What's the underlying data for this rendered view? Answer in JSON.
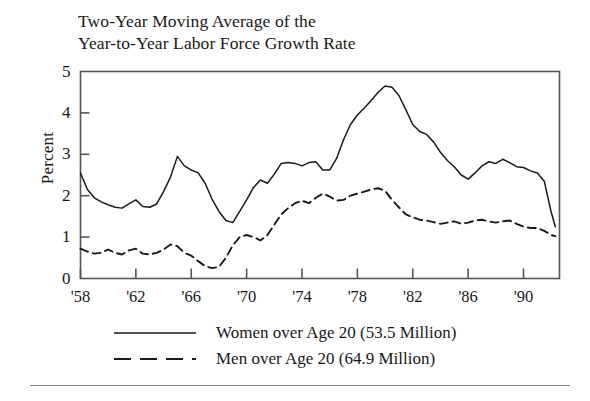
{
  "title": {
    "line1": "Two-Year Moving Average of the",
    "line2": "Year-to-Year Labor Force Growth Rate"
  },
  "axes": {
    "ylabel": "Percent",
    "yticks": [
      "0",
      "1",
      "2",
      "3",
      "4",
      "5"
    ],
    "xticks": [
      "'58",
      "'62",
      "'66",
      "'70",
      "'74",
      "'78",
      "'82",
      "'86",
      "'90"
    ]
  },
  "legend": {
    "items": [
      {
        "label": "Women over Age 20 (53.5 Million)",
        "style": "solid",
        "color": "#1a1a1a"
      },
      {
        "label": "Men over Age 20 (64.9 Million)",
        "style": "dashed",
        "color": "#1a1a1a"
      }
    ]
  },
  "colors": {
    "ink": "#1a1a1a",
    "frame": "#555555",
    "rule": "#8a8a8a",
    "background": "#ffffff"
  },
  "chart_data": {
    "type": "line",
    "title": "Two-Year Moving Average of the Year-to-Year Labor Force Growth Rate",
    "xlabel": "",
    "ylabel": "Percent",
    "xlim": [
      1958,
      1992.6
    ],
    "ylim": [
      0,
      5
    ],
    "grid": false,
    "legend_position": "below",
    "x_tick_values": [
      1958,
      1962,
      1966,
      1970,
      1974,
      1978,
      1982,
      1986,
      1990
    ],
    "x_tick_labels": [
      "'58",
      "'62",
      "'66",
      "'70",
      "'74",
      "'78",
      "'82",
      "'86",
      "'90"
    ],
    "y_tick_values": [
      0,
      1,
      2,
      3,
      4,
      5
    ],
    "y_tick_labels": [
      "0",
      "1",
      "2",
      "3",
      "4",
      "5"
    ],
    "x": [
      1958.0,
      1958.5,
      1959.0,
      1959.5,
      1960.0,
      1960.5,
      1961.0,
      1961.5,
      1962.0,
      1962.5,
      1963.0,
      1963.5,
      1964.0,
      1964.5,
      1965.0,
      1965.5,
      1966.0,
      1966.5,
      1967.0,
      1967.5,
      1968.0,
      1968.5,
      1969.0,
      1969.5,
      1970.0,
      1970.5,
      1971.0,
      1971.5,
      1972.0,
      1972.5,
      1973.0,
      1973.5,
      1974.0,
      1974.5,
      1975.0,
      1975.5,
      1976.0,
      1976.5,
      1977.0,
      1977.5,
      1978.0,
      1978.5,
      1979.0,
      1979.5,
      1980.0,
      1980.5,
      1981.0,
      1981.5,
      1982.0,
      1982.5,
      1983.0,
      1983.5,
      1984.0,
      1984.5,
      1985.0,
      1985.5,
      1986.0,
      1986.5,
      1987.0,
      1987.5,
      1988.0,
      1988.5,
      1989.0,
      1989.5,
      1990.0,
      1990.5,
      1991.0,
      1991.5,
      1992.0,
      1992.3
    ],
    "series": [
      {
        "name": "Women over Age 20 (53.5 Million)",
        "style": "solid",
        "color": "#1a1a1a",
        "values": [
          2.55,
          2.15,
          1.95,
          1.85,
          1.78,
          1.72,
          1.7,
          1.8,
          1.9,
          1.74,
          1.72,
          1.8,
          2.1,
          2.45,
          2.95,
          2.72,
          2.62,
          2.55,
          2.3,
          1.92,
          1.62,
          1.4,
          1.35,
          1.62,
          1.9,
          2.2,
          2.38,
          2.3,
          2.52,
          2.78,
          2.8,
          2.78,
          2.72,
          2.8,
          2.82,
          2.62,
          2.62,
          2.9,
          3.35,
          3.72,
          3.95,
          4.12,
          4.3,
          4.5,
          4.65,
          4.62,
          4.42,
          4.08,
          3.72,
          3.55,
          3.48,
          3.3,
          3.05,
          2.85,
          2.7,
          2.5,
          2.4,
          2.55,
          2.72,
          2.82,
          2.78,
          2.88,
          2.8,
          2.7,
          2.68,
          2.6,
          2.55,
          2.35,
          1.6,
          1.25
        ]
      },
      {
        "name": "Men over Age 20 (64.9 Million)",
        "style": "dashed",
        "color": "#1a1a1a",
        "values": [
          0.72,
          0.65,
          0.6,
          0.62,
          0.7,
          0.62,
          0.58,
          0.68,
          0.72,
          0.6,
          0.58,
          0.62,
          0.7,
          0.82,
          0.78,
          0.62,
          0.55,
          0.42,
          0.3,
          0.25,
          0.28,
          0.5,
          0.8,
          1.0,
          1.05,
          1.0,
          0.92,
          1.05,
          1.3,
          1.55,
          1.7,
          1.82,
          1.88,
          1.82,
          1.95,
          2.05,
          1.98,
          1.88,
          1.9,
          2.0,
          2.05,
          2.1,
          2.15,
          2.18,
          2.12,
          1.9,
          1.72,
          1.55,
          1.48,
          1.42,
          1.4,
          1.36,
          1.32,
          1.35,
          1.38,
          1.32,
          1.35,
          1.4,
          1.42,
          1.38,
          1.35,
          1.38,
          1.4,
          1.32,
          1.25,
          1.22,
          1.22,
          1.15,
          1.05,
          1.02
        ]
      }
    ]
  }
}
